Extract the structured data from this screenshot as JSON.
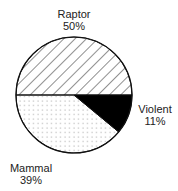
{
  "chart_data": {
    "type": "pie",
    "title": "",
    "start": "left-horizontal, clockwise",
    "slices": [
      {
        "label": "Raptor",
        "value": 50,
        "percent_label": "50%",
        "fill": "hatch"
      },
      {
        "label": "Violent",
        "value": 11,
        "percent_label": "11%",
        "fill": "solid"
      },
      {
        "label": "Mammal",
        "value": 39,
        "percent_label": "39%",
        "fill": "dots"
      }
    ],
    "colors": {
      "outline": "#111111",
      "solid": "#000000",
      "hatch": "#333333",
      "dots": "#9a9a9a",
      "background": "#ffffff"
    }
  }
}
